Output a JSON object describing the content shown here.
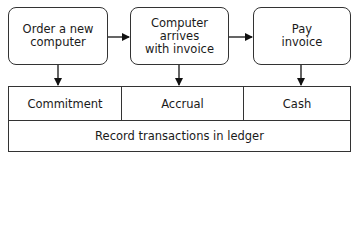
{
  "diagram": {
    "steps": [
      {
        "label": "Order a new\ncomputer"
      },
      {
        "label": "Computer arrives\nwith invoice"
      },
      {
        "label": "Pay\ninvoice"
      }
    ],
    "recognition_bases": [
      {
        "label": "Commitment"
      },
      {
        "label": "Accrual"
      },
      {
        "label": "Cash"
      }
    ],
    "ledger": {
      "label": "Record transactions in ledger"
    },
    "colors": {
      "stroke": "#333333",
      "background": "#ffffff",
      "text": "#1a1a1a"
    }
  }
}
